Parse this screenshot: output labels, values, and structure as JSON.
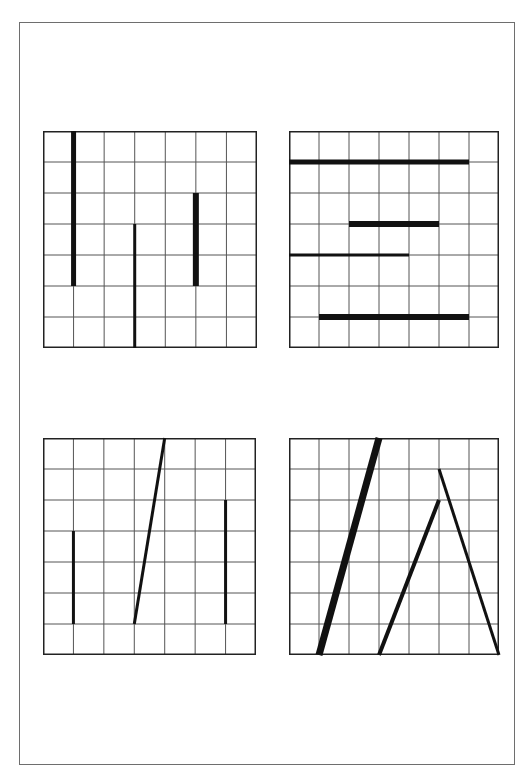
{
  "figure": {
    "grid": {
      "cols": 7,
      "rows": 7,
      "grid_line_color": "#555555",
      "border_color": "#222222",
      "segment_color": "#111111"
    },
    "panels": [
      {
        "id": "top-left",
        "x": 43,
        "y": 131,
        "w": 214,
        "h": 217,
        "segments": [
          {
            "x1": 1,
            "y1": 0,
            "x2": 1,
            "y2": 5,
            "width": 5
          },
          {
            "x1": 3,
            "y1": 3,
            "x2": 3,
            "y2": 7,
            "width": 3
          },
          {
            "x1": 5,
            "y1": 2,
            "x2": 5,
            "y2": 5,
            "width": 6
          }
        ]
      },
      {
        "id": "top-right",
        "x": 289,
        "y": 131,
        "w": 210,
        "h": 217,
        "segments": [
          {
            "x1": 0,
            "y1": 1,
            "x2": 6,
            "y2": 1,
            "width": 5
          },
          {
            "x1": 2,
            "y1": 3,
            "x2": 5,
            "y2": 3,
            "width": 6
          },
          {
            "x1": 0,
            "y1": 4,
            "x2": 4,
            "y2": 4,
            "width": 3
          },
          {
            "x1": 1,
            "y1": 6,
            "x2": 6,
            "y2": 6,
            "width": 6
          }
        ]
      },
      {
        "id": "bottom-left",
        "x": 43,
        "y": 438,
        "w": 213,
        "h": 217,
        "segments": [
          {
            "x1": 1,
            "y1": 3,
            "x2": 1,
            "y2": 6,
            "width": 3
          },
          {
            "x1": 3,
            "y1": 6,
            "x2": 4,
            "y2": 0,
            "width": 3
          },
          {
            "x1": 6,
            "y1": 2,
            "x2": 6,
            "y2": 6,
            "width": 3
          }
        ]
      },
      {
        "id": "bottom-right",
        "x": 289,
        "y": 438,
        "w": 210,
        "h": 217,
        "segments": [
          {
            "x1": 1,
            "y1": 7,
            "x2": 3,
            "y2": 0,
            "width": 7
          },
          {
            "x1": 3,
            "y1": 7,
            "x2": 5,
            "y2": 2,
            "width": 4
          },
          {
            "x1": 5,
            "y1": 1,
            "x2": 7,
            "y2": 7,
            "width": 3
          }
        ]
      }
    ]
  }
}
